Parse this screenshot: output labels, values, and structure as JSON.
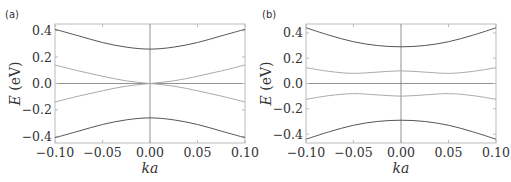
{
  "chart_data": [
    {
      "type": "line",
      "panel_label": "(a)",
      "xlabel": "ka",
      "ylabel": "E (eV)",
      "ylabel_parts": {
        "italic": "E",
        "unit": " (eV)"
      },
      "xlim": [
        -0.1,
        0.1
      ],
      "ylim": [
        -0.45,
        0.45
      ],
      "xticks": [
        "-0.10",
        "-0.05",
        "0.00",
        "0.05",
        "0.10"
      ],
      "xtick_values": [
        -0.1,
        -0.05,
        0.0,
        0.05,
        0.1
      ],
      "yticks": [
        "0.4",
        "0.2",
        "0.0",
        "-0.2",
        "-0.4"
      ],
      "ytick_values": [
        0.4,
        0.2,
        0.0,
        -0.2,
        -0.4
      ],
      "grid": false,
      "zero_lines": true,
      "x": [
        -0.1,
        -0.075,
        -0.05,
        -0.025,
        0.0,
        0.025,
        0.05,
        0.075,
        0.1
      ],
      "series": [
        {
          "name": "upper outer band",
          "color": "#555555",
          "values": [
            0.41,
            0.36,
            0.31,
            0.275,
            0.26,
            0.275,
            0.31,
            0.36,
            0.41
          ]
        },
        {
          "name": "upper inner band",
          "color": "#aaaaaa",
          "values": [
            0.14,
            0.095,
            0.055,
            0.02,
            0.0,
            -0.02,
            -0.055,
            -0.095,
            -0.14
          ]
        },
        {
          "name": "lower inner band",
          "color": "#aaaaaa",
          "values": [
            -0.14,
            -0.095,
            -0.055,
            -0.02,
            0.0,
            0.02,
            0.055,
            0.095,
            0.14
          ]
        },
        {
          "name": "lower outer band",
          "color": "#555555",
          "values": [
            -0.41,
            -0.36,
            -0.31,
            -0.275,
            -0.26,
            -0.275,
            -0.31,
            -0.36,
            -0.41
          ]
        }
      ]
    },
    {
      "type": "line",
      "panel_label": "(b)",
      "xlabel": "ka",
      "ylabel": "E (eV)",
      "ylabel_parts": {
        "italic": "E",
        "unit": " (eV)"
      },
      "xlim": [
        -0.1,
        0.1
      ],
      "ylim": [
        -0.47,
        0.47
      ],
      "xticks": [
        "-0.10",
        "-0.05",
        "0.00",
        "0.05",
        "0.10"
      ],
      "xtick_values": [
        -0.1,
        -0.05,
        0.0,
        0.05,
        0.1
      ],
      "yticks": [
        "0.4",
        "0.2",
        "0.0",
        "-0.2",
        "-0.4"
      ],
      "ytick_values": [
        0.4,
        0.2,
        0.0,
        -0.2,
        -0.4
      ],
      "grid": false,
      "zero_lines": true,
      "x": [
        -0.1,
        -0.075,
        -0.05,
        -0.025,
        0.0,
        0.025,
        0.05,
        0.075,
        0.1
      ],
      "series": [
        {
          "name": "upper outer band",
          "color": "#555555",
          "values": [
            0.44,
            0.38,
            0.33,
            0.3,
            0.29,
            0.3,
            0.33,
            0.38,
            0.44
          ]
        },
        {
          "name": "upper inner band",
          "color": "#aaaaaa",
          "values": [
            0.125,
            0.095,
            0.08,
            0.09,
            0.1,
            0.09,
            0.08,
            0.095,
            0.125
          ]
        },
        {
          "name": "lower inner band",
          "color": "#aaaaaa",
          "values": [
            -0.125,
            -0.095,
            -0.08,
            -0.09,
            -0.1,
            -0.09,
            -0.08,
            -0.095,
            -0.125
          ]
        },
        {
          "name": "lower outer band",
          "color": "#555555",
          "values": [
            -0.44,
            -0.38,
            -0.33,
            -0.3,
            -0.29,
            -0.3,
            -0.33,
            -0.38,
            -0.44
          ]
        }
      ]
    }
  ],
  "layout": {
    "panels": [
      {
        "left": 55,
        "right": 245,
        "top": 24,
        "bottom": 143,
        "label_x": 5,
        "label_y": 18,
        "ylabel_x": 20
      },
      {
        "left": 306,
        "right": 496,
        "top": 24,
        "bottom": 143,
        "label_x": 262,
        "label_y": 18,
        "ylabel_x": 271
      }
    ],
    "frame_color": "#bbbbbb",
    "zero_line_color": "#777777"
  }
}
